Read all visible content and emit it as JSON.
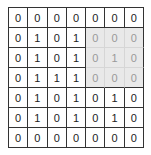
{
  "matrix": {
    "rows": 7,
    "cols": 7,
    "values": [
      [
        0,
        0,
        0,
        0,
        0,
        0,
        0
      ],
      [
        0,
        1,
        0,
        1,
        0,
        0,
        0
      ],
      [
        0,
        1,
        0,
        1,
        0,
        1,
        0
      ],
      [
        0,
        1,
        1,
        1,
        0,
        0,
        0
      ],
      [
        0,
        1,
        0,
        1,
        0,
        1,
        0
      ],
      [
        0,
        1,
        0,
        1,
        0,
        1,
        0
      ],
      [
        0,
        0,
        0,
        0,
        0,
        0,
        0
      ]
    ],
    "highlight": {
      "row_start": 1,
      "row_end": 3,
      "col_start": 4,
      "col_end": 6,
      "fill_color": "#e9e9e9",
      "text_color": "#9a9a9a"
    }
  }
}
